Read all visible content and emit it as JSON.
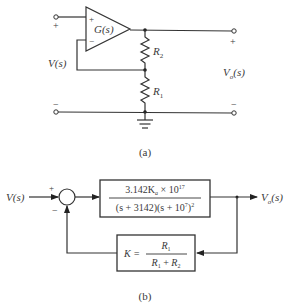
{
  "figure": {
    "part_a": {
      "caption": "(a)",
      "opamp_label": "G(s)",
      "opamp_plus": "+",
      "opamp_minus": "−",
      "input_label": "V(s)",
      "input_plus": "+",
      "input_minus": "−",
      "output_label_main": "V",
      "output_label_sub": "o",
      "output_label_arg": "(s)",
      "output_plus": "+",
      "output_minus": "−",
      "r2_main": "R",
      "r2_sub": "2",
      "r1_main": "R",
      "r1_sub": "1"
    },
    "part_b": {
      "caption": "(b)",
      "input_label": "V(s)",
      "sum_plus": "+",
      "sum_minus": "−",
      "forward_numerator_a": "3.142K",
      "forward_numerator_sub": "a",
      "forward_numerator_b": " × 10",
      "forward_numerator_exp": "17",
      "forward_denominator_a": "(s + 3142)(s + 10",
      "forward_denominator_exp1": "7",
      "forward_denominator_b": ")",
      "forward_denominator_exp2": "2",
      "feedback_lhs": "K =",
      "feedback_num_main": "R",
      "feedback_num_sub": "1",
      "feedback_den_a": "R",
      "feedback_den_a_sub": "1",
      "feedback_den_plus": " + ",
      "feedback_den_b": "R",
      "feedback_den_b_sub": "2",
      "output_label_main": "V",
      "output_label_sub": "o",
      "output_label_arg": "(s)"
    }
  }
}
